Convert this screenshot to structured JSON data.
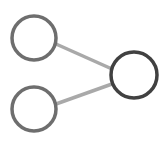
{
  "diagram": {
    "type": "node-link",
    "colors": {
      "background": "#ffffff",
      "input_node_stroke": "#6e6e6e",
      "output_node_stroke": "#414141",
      "edge_stroke": "#a9a9a9"
    },
    "nodes": [
      {
        "id": "input-top",
        "cx": 34,
        "cy": 38,
        "r": 22
      },
      {
        "id": "input-bottom",
        "cx": 34,
        "cy": 109,
        "r": 22
      },
      {
        "id": "output",
        "cx": 134,
        "cy": 75,
        "r": 23
      }
    ],
    "edges": [
      {
        "from": "input-top",
        "to": "output",
        "x1": 56,
        "y1": 44,
        "x2": 112,
        "y2": 69
      },
      {
        "from": "input-bottom",
        "to": "output",
        "x1": 56,
        "y1": 104,
        "x2": 112,
        "y2": 84
      }
    ]
  }
}
